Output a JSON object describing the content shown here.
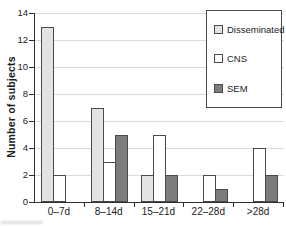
{
  "chart_data": {
    "type": "bar",
    "title": "",
    "categories": [
      "0–7d",
      "8–14d",
      "15–21d",
      "22–28d",
      ">28d"
    ],
    "series": [
      {
        "name": "Disseminated",
        "color": "#e3e3e1",
        "values": [
          13,
          7,
          2,
          0,
          0
        ]
      },
      {
        "name": "CNS",
        "color": "#ffffff",
        "values": [
          2,
          3,
          5,
          2,
          4
        ]
      },
      {
        "name": "SEM",
        "color": "#7c7c7c",
        "values": [
          0,
          5,
          2,
          1,
          2
        ]
      }
    ],
    "xlabel": "",
    "ylabel": "Number of subjects",
    "ylim": [
      0,
      14
    ],
    "yticks": [
      0,
      2,
      4,
      6,
      8,
      10,
      12,
      14
    ],
    "grid": "horizontal",
    "legend_position": "top-right"
  },
  "colors": {
    "axis": "#2e2e2e",
    "grid": "#dbdbdb",
    "bar_border": "#4a4a4a",
    "legend_border": "#4a4a4a",
    "text": "#1c1c1c",
    "background": "#ffffff"
  }
}
